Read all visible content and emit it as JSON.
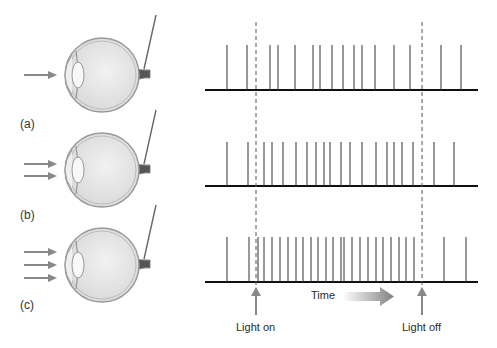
{
  "figure": {
    "panels": [
      {
        "id": "a",
        "label": "(a)",
        "light_arrows": 1,
        "baseline_y": 90,
        "spike_top": 45,
        "eye_cy": 75,
        "spikes_x": [
          227,
          247,
          270,
          278,
          295,
          313,
          320,
          332,
          343,
          354,
          362,
          375,
          394,
          410,
          441,
          461
        ]
      },
      {
        "id": "b",
        "label": "(b)",
        "light_arrows": 2,
        "baseline_y": 186,
        "spike_top": 142,
        "eye_cy": 170,
        "spikes_x": [
          227,
          248,
          264,
          272,
          283,
          296,
          307,
          316,
          324,
          330,
          341,
          350,
          362,
          376,
          387,
          394,
          402,
          413,
          434,
          454
        ]
      },
      {
        "id": "c",
        "label": "(c)",
        "light_arrows": 3,
        "baseline_y": 282,
        "spike_top": 237,
        "eye_cy": 265,
        "spikes_x": [
          227,
          249,
          258,
          264,
          272,
          280,
          288,
          296,
          303,
          311,
          318,
          326,
          333,
          341,
          344,
          352,
          360,
          368,
          376,
          383,
          391,
          399,
          406,
          414,
          444,
          466
        ]
      }
    ],
    "axis": {
      "x_start": 205,
      "x_end": 478
    },
    "light_on": {
      "label": "Light on",
      "x": 256
    },
    "light_off": {
      "label": "Light off",
      "x": 422
    },
    "time_label": "Time",
    "colors": {
      "spike": "#333333",
      "baseline": "#111111",
      "arrow": "#888888",
      "eye_fill": "#e6e6e6",
      "eye_stroke": "#9a9a9a"
    }
  }
}
